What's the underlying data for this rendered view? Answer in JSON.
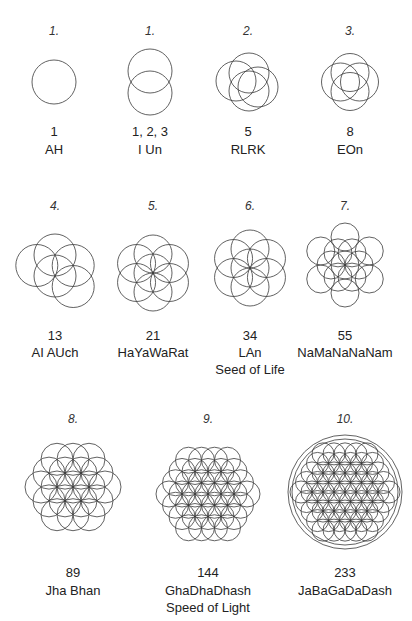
{
  "figures": [
    {
      "step": "1.",
      "number": "1",
      "name": "AH",
      "extra": "",
      "pattern": "single",
      "cx": 54,
      "cy": 82,
      "r": 22,
      "step_y": 24,
      "num_y": 124,
      "name_y": 142
    },
    {
      "step": "1.",
      "number": "1, 2, 3",
      "name": "I Un",
      "extra": "",
      "pattern": "vesica",
      "cx": 150,
      "cy": 82,
      "r": 22,
      "step_y": 24,
      "num_y": 124,
      "name_y": 142
    },
    {
      "step": "2.",
      "number": "5",
      "name": "RLRK",
      "extra": "",
      "pattern": "tripod",
      "cx": 248,
      "cy": 82,
      "r": 20,
      "step_y": 24,
      "num_y": 124,
      "name_y": 142
    },
    {
      "step": "3.",
      "number": "8",
      "name": "EOn",
      "extra": "",
      "pattern": "quad",
      "cx": 350,
      "cy": 82,
      "r": 19,
      "step_y": 24,
      "num_y": 124,
      "name_y": 142
    },
    {
      "step": "4.",
      "number": "13",
      "name": "AI AUch",
      "extra": "",
      "pattern": "five",
      "cx": 55,
      "cy": 276,
      "r": 21,
      "step_y": 199,
      "num_y": 328,
      "name_y": 345
    },
    {
      "step": "5.",
      "number": "21",
      "name": "HaYaWaRat",
      "extra": "",
      "pattern": "six",
      "cx": 153,
      "cy": 273,
      "r": 19,
      "step_y": 199,
      "num_y": 328,
      "name_y": 345
    },
    {
      "step": "6.",
      "number": "34",
      "name": "LAn",
      "extra": "Seed of Life",
      "pattern": "seed",
      "cx": 250,
      "cy": 268,
      "r": 19,
      "step_y": 199,
      "num_y": 328,
      "name_y": 345,
      "extra_y": 362
    },
    {
      "step": "7.",
      "number": "55",
      "name": "NaMaNaNaNam",
      "extra": "",
      "pattern": "egg",
      "cx": 345,
      "cy": 265,
      "r": 14,
      "step_y": 199,
      "num_y": 328,
      "name_y": 345
    },
    {
      "step": "8.",
      "number": "89",
      "name": "Jha Bhan",
      "extra": "",
      "pattern": "fruit",
      "cx": 73,
      "cy": 487,
      "r": 16,
      "step_y": 412,
      "num_y": 565,
      "name_y": 583
    },
    {
      "step": "9.",
      "number": "144",
      "name": "GhaDhaDhash",
      "extra": "Speed of Light",
      "pattern": "hex3",
      "cx": 208,
      "cy": 494,
      "r": 13,
      "step_y": 412,
      "num_y": 565,
      "name_y": 583,
      "extra_y": 600
    },
    {
      "step": "10.",
      "number": "233",
      "name": "JaBaGaDaDash",
      "extra": "",
      "pattern": "flower",
      "cx": 345,
      "cy": 492,
      "r": 11,
      "step_y": 412,
      "num_y": 565,
      "name_y": 583,
      "outer_r": [
        53,
        57
      ]
    }
  ],
  "style": {
    "stroke": "#3a3a3a",
    "background": "#ffffff",
    "text": "#222222"
  }
}
